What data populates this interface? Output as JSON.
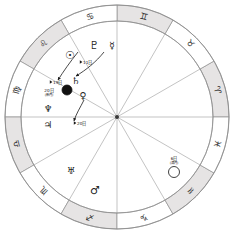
{
  "chart": {
    "ring": {
      "outer_radius": 112,
      "inner_radius": 96,
      "shaded_fill": "#e6e4e4",
      "plain_fill": "#ffffff",
      "stroke": "#8f8f8f"
    },
    "hub_color": "#3a3a3a",
    "spokes": 12
  },
  "zodiac": [
    {
      "name": "capricorn",
      "glyph": "♑",
      "angle_deg": 285
    },
    {
      "name": "sagittarius",
      "glyph": "♐",
      "angle_deg": 255
    },
    {
      "name": "scorpio",
      "glyph": "♏",
      "angle_deg": 225
    },
    {
      "name": "libra",
      "glyph": "♎",
      "angle_deg": 195
    },
    {
      "name": "virgo",
      "glyph": "♍",
      "angle_deg": 165
    },
    {
      "name": "leo",
      "glyph": "♌",
      "angle_deg": 135
    },
    {
      "name": "cancer",
      "glyph": "♋",
      "angle_deg": 105
    },
    {
      "name": "gemini",
      "glyph": "♊",
      "angle_deg": 75
    },
    {
      "name": "taurus",
      "glyph": "♉",
      "angle_deg": 45
    },
    {
      "name": "aries",
      "glyph": "♈",
      "angle_deg": 15
    },
    {
      "name": "pisces",
      "glyph": "♓",
      "angle_deg": 345
    },
    {
      "name": "aquarius",
      "glyph": "♒",
      "angle_deg": 315
    }
  ],
  "planets": [
    {
      "name": "sun",
      "glyph": "☉",
      "x": 70,
      "y": 55,
      "size": "big"
    },
    {
      "name": "pluto",
      "glyph": "♇",
      "x": 94,
      "y": 45,
      "size": "big"
    },
    {
      "name": "mercury",
      "glyph": "☿",
      "x": 112,
      "y": 45,
      "size": "normal"
    },
    {
      "name": "saturn",
      "glyph": "♄",
      "x": 76,
      "y": 80,
      "size": "normal"
    },
    {
      "name": "venus",
      "glyph": "♀",
      "x": 83,
      "y": 95,
      "size": "normal"
    },
    {
      "name": "neptune",
      "glyph": "♆",
      "x": 48,
      "y": 108,
      "size": "normal"
    },
    {
      "name": "jupiter",
      "glyph": "♃",
      "x": 48,
      "y": 124,
      "size": "normal"
    },
    {
      "name": "uranus",
      "glyph": "♅",
      "x": 71,
      "y": 170,
      "size": "normal"
    },
    {
      "name": "mars",
      "glyph": "♂",
      "x": 95,
      "y": 190,
      "size": "big"
    }
  ],
  "moon_markers": [
    {
      "name": "new-moon",
      "shape": "filled",
      "cx": 67,
      "cy": 90,
      "r": 5,
      "fill": "#111111",
      "label_line1": "20日",
      "label_line2": "(新月)",
      "label_x": 49,
      "label_y": 90
    },
    {
      "name": "full-moon",
      "shape": "open",
      "cx": 174,
      "cy": 172,
      "r": 5.5,
      "fill": "#ffffff",
      "label_line1": "6日",
      "label_line2": "(満月)",
      "label_x": 174,
      "label_y": 158
    }
  ],
  "date_annotations": [
    {
      "name": "day-19-label",
      "text": "19日",
      "x": 53,
      "y": 82
    },
    {
      "name": "day-11-label",
      "text": "11日",
      "x": 83,
      "y": 62
    },
    {
      "name": "day-20b-label",
      "text": "20日",
      "x": 77,
      "y": 123
    }
  ],
  "arrows": [
    {
      "name": "arrow-sun-to-newmoon",
      "path": "M 78 52 C 70 62, 63 72, 58 80"
    },
    {
      "name": "arrow-mercury-to-inner",
      "path": "M 104 52 C 96 62, 86 70, 76 76"
    },
    {
      "name": "arrow-venus-down",
      "path": "M 84 100 C 80 108, 76 114, 74 121"
    }
  ]
}
